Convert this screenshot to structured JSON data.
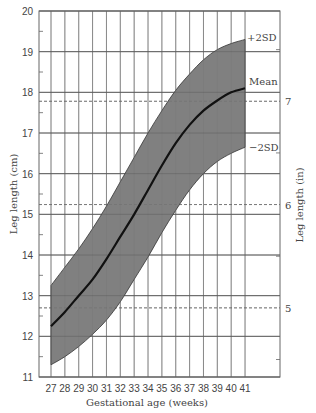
{
  "chart_data": {
    "type": "area",
    "title": "",
    "xlabel": "Gestational age (weeks)",
    "ylabel": "Leg length (cm)",
    "ylabel_right": "Leg length (in)",
    "x": [
      27,
      28,
      29,
      30,
      31,
      32,
      33,
      34,
      35,
      36,
      37,
      38,
      39,
      40,
      41
    ],
    "xticks": [
      "27",
      "28",
      "29",
      "30",
      "31",
      "32",
      "33",
      "34",
      "35",
      "36",
      "37",
      "38",
      "39",
      "40",
      "41"
    ],
    "ylim": [
      11,
      20
    ],
    "yticks": [
      "11",
      "12",
      "13",
      "14",
      "15",
      "16",
      "17",
      "18",
      "19",
      "20"
    ],
    "yticks_right": [
      "5",
      "6",
      "7"
    ],
    "yticks_right_cm": [
      12.7,
      15.24,
      17.78
    ],
    "grid": true,
    "series": [
      {
        "name": "+2SD",
        "values": [
          13.25,
          13.7,
          14.15,
          14.65,
          15.2,
          15.8,
          16.4,
          17.0,
          17.55,
          18.05,
          18.45,
          18.8,
          19.05,
          19.2,
          19.3
        ]
      },
      {
        "name": "Mean",
        "values": [
          12.25,
          12.6,
          13.0,
          13.4,
          13.9,
          14.45,
          15.0,
          15.6,
          16.2,
          16.75,
          17.2,
          17.55,
          17.8,
          18.0,
          18.1
        ]
      },
      {
        "name": "-2SD",
        "values": [
          11.3,
          11.5,
          11.75,
          12.05,
          12.4,
          12.85,
          13.4,
          13.95,
          14.55,
          15.1,
          15.6,
          16.0,
          16.3,
          16.5,
          16.65
        ]
      }
    ],
    "annotations": [
      "+2SD",
      "Mean",
      "−2SD"
    ],
    "band_color": "#808080",
    "line_color": "#111111",
    "grid_color": "#777777"
  }
}
